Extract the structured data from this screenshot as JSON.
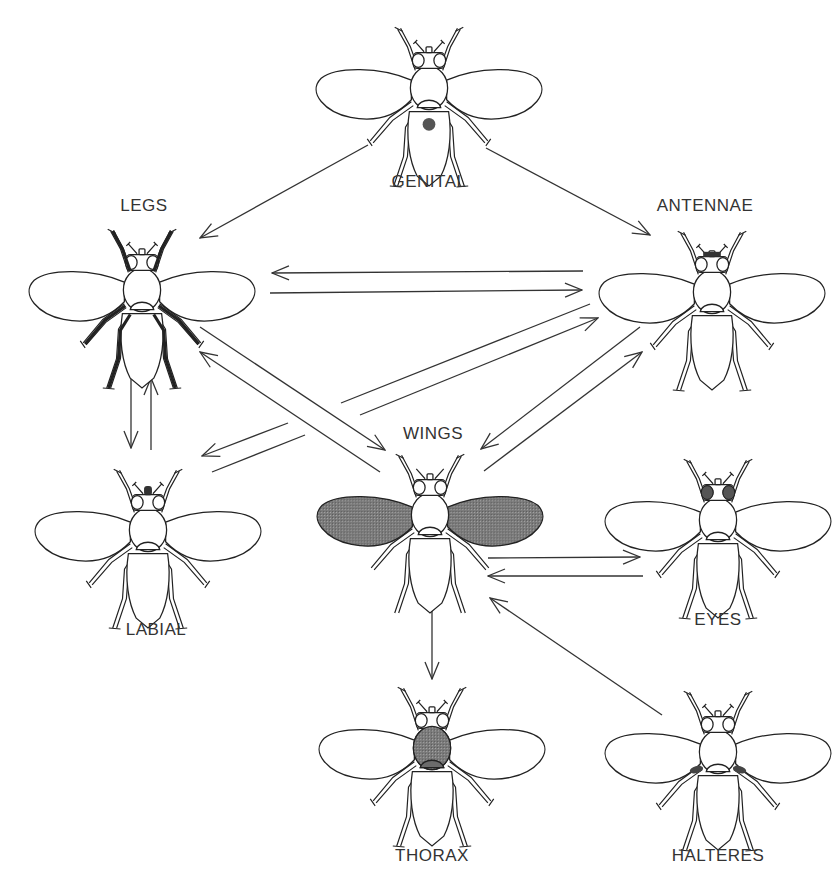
{
  "diagram": {
    "type": "directed-graph",
    "colors": {
      "line": "#333333",
      "highlight": "#6b6b6b",
      "genital_dot": "#555555",
      "background": "#ffffff"
    },
    "nodes": [
      {
        "id": "genital",
        "label": "GENITAL",
        "x": 429,
        "y": 88,
        "highlight": "genital-dot"
      },
      {
        "id": "legs",
        "label": "LEGS",
        "x": 142,
        "y": 290,
        "highlight": "legs"
      },
      {
        "id": "antennae",
        "label": "ANTENNAE",
        "x": 712,
        "y": 292,
        "highlight": "antennae"
      },
      {
        "id": "labial",
        "label": "LABIAL",
        "x": 148,
        "y": 530,
        "highlight": "proboscis"
      },
      {
        "id": "wings",
        "label": "WINGS",
        "x": 430,
        "y": 515,
        "highlight": "wings"
      },
      {
        "id": "eyes",
        "label": "EYES",
        "x": 718,
        "y": 520,
        "highlight": "eyes"
      },
      {
        "id": "thorax",
        "label": "THORAX",
        "x": 432,
        "y": 748,
        "highlight": "thorax"
      },
      {
        "id": "halteres",
        "label": "HALTERES",
        "x": 718,
        "y": 752,
        "highlight": "halteres"
      }
    ],
    "edges": [
      {
        "from": "genital",
        "to": "legs"
      },
      {
        "from": "genital",
        "to": "antennae"
      },
      {
        "from": "antennae",
        "to": "legs"
      },
      {
        "from": "legs",
        "to": "antennae"
      },
      {
        "from": "legs",
        "to": "labial"
      },
      {
        "from": "labial",
        "to": "legs"
      },
      {
        "from": "legs",
        "to": "wings"
      },
      {
        "from": "wings",
        "to": "legs"
      },
      {
        "from": "antennae",
        "to": "labial"
      },
      {
        "from": "labial",
        "to": "antennae"
      },
      {
        "from": "antennae",
        "to": "wings"
      },
      {
        "from": "wings",
        "to": "antennae"
      },
      {
        "from": "wings",
        "to": "eyes"
      },
      {
        "from": "eyes",
        "to": "wings"
      },
      {
        "from": "wings",
        "to": "thorax"
      },
      {
        "from": "halteres",
        "to": "wings"
      }
    ]
  },
  "labels": {
    "genital": "GENITAL",
    "legs": "LEGS",
    "antennae": "ANTENNAE",
    "labial": "LABIAL",
    "wings": "WINGS",
    "eyes": "EYES",
    "thorax": "THORAX",
    "halteres": "HALTERES"
  }
}
